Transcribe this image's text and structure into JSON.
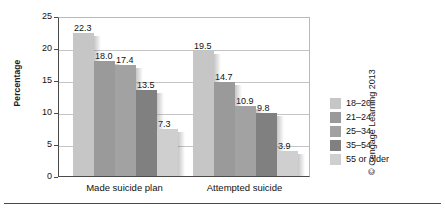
{
  "chart_data": {
    "type": "bar",
    "title": "",
    "xlabel": "",
    "ylabel": "Percentage",
    "categories": [
      "Made suicide plan",
      "Attempted suicide"
    ],
    "series": [
      {
        "name": "18–20",
        "color": "#c6c6c6",
        "values": [
          22.3,
          19.5
        ]
      },
      {
        "name": "21–24",
        "color": "#9a9a9a",
        "values": [
          18.0,
          14.7
        ]
      },
      {
        "name": "25–34",
        "color": "#a2a2a2",
        "values": [
          17.4,
          10.9
        ]
      },
      {
        "name": "35–54",
        "color": "#808080",
        "values": [
          13.5,
          9.8
        ]
      },
      {
        "name": "55 or older",
        "color": "#cfcfcf",
        "values": [
          7.3,
          3.9
        ]
      }
    ],
    "ylim": [
      0,
      25
    ],
    "yticks": [
      0,
      5,
      10,
      15,
      20,
      25
    ],
    "ytick_labels": [
      "0",
      "5",
      "10",
      "15",
      "20",
      "25"
    ],
    "grid": true,
    "legend_position": "right",
    "value_labels": [
      "22.3",
      "18.0",
      "17.4",
      "13.5",
      "7.3",
      "19.5",
      "14.7",
      "10.9",
      "9.8",
      "3.9"
    ]
  },
  "legend": {
    "items": [
      {
        "label": "18–20"
      },
      {
        "label": "21–24"
      },
      {
        "label": "25–34"
      },
      {
        "label": "35–54"
      },
      {
        "label": "55 or older"
      }
    ]
  },
  "credit": {
    "text": "© Cengage Learning 2013"
  }
}
